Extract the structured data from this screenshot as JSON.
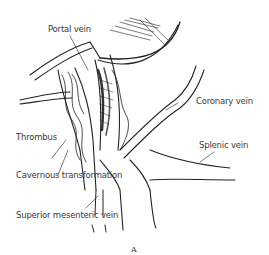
{
  "figure": {
    "panel_letter": "A",
    "labels": {
      "portal_vein": "Portal vein",
      "coronary_vein": "Coronary vein",
      "thrombus": "Thrombus",
      "cavernous_transformation": "Cavernous transformation",
      "splenic_vein": "Splenic vein",
      "superior_mesenteric_vein": "Superior mesenteric vein"
    }
  }
}
